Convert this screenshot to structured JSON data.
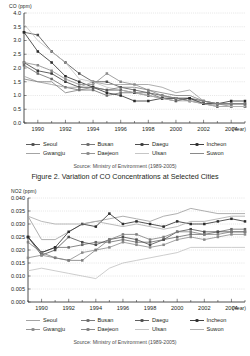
{
  "figure1": {
    "axis_label": "CO (ppm)",
    "source": "Source: Ministry of Environment (1989-2005)",
    "caption": "Figure 2. Variation of CO Concentrations at Selected Cities",
    "legend": [
      {
        "label": "Seoul",
        "color": "#4d4d4d",
        "marker": "square"
      },
      {
        "label": "Busan",
        "color": "#6b6b6b",
        "marker": "square"
      },
      {
        "label": "Daegu",
        "color": "#3a3a3a",
        "marker": "square"
      },
      {
        "label": "Incheon",
        "color": "#2b2b2b",
        "marker": "square"
      },
      {
        "label": "Gwangju",
        "color": "#9a9a9a",
        "marker": "none"
      },
      {
        "label": "Daejeon",
        "color": "#8a8a8a",
        "marker": "square"
      },
      {
        "label": "Ulsan",
        "color": "#c0c0c0",
        "marker": "none"
      },
      {
        "label": "Suwon",
        "color": "#7d7d7d",
        "marker": "none"
      }
    ]
  },
  "figure2": {
    "axis_label": "NO2 (ppm)",
    "source": "Source: Ministry of Environment (1989-2005)",
    "legend": [
      {
        "label": "Seoul",
        "color": "#9a9a9a",
        "marker": "none"
      },
      {
        "label": "Busan",
        "color": "#6b6b6b",
        "marker": "square"
      },
      {
        "label": "Daegu",
        "color": "#4d4d4d",
        "marker": "square"
      },
      {
        "label": "Incheon",
        "color": "#2b2b2b",
        "marker": "square"
      },
      {
        "label": "Gwangju",
        "color": "#8a8a8a",
        "marker": "square"
      },
      {
        "label": "Daejeon",
        "color": "#7d7d7d",
        "marker": "square"
      },
      {
        "label": "Ulsan",
        "color": "#c0c0c0",
        "marker": "none"
      },
      {
        "label": "Suwon",
        "color": "#a8a8a8",
        "marker": "none"
      }
    ]
  },
  "chart_data": [
    {
      "id": "co",
      "type": "line",
      "title": "Figure 2. Variation of CO Concentrations at Selected Cities",
      "xlabel": "(Year)",
      "ylabel": "CO (ppm)",
      "ylim": [
        0.0,
        4.0
      ],
      "ytick_labels": [
        "4.0",
        "3.5",
        "3.0",
        "2.5",
        "2.0",
        "1.5",
        "1.0",
        "0.5",
        "0.0"
      ],
      "ytick_values": [
        4.0,
        3.5,
        3.0,
        2.5,
        2.0,
        1.5,
        1.0,
        0.5,
        0.0
      ],
      "xlim": [
        1989,
        2005
      ],
      "x": [
        1989,
        1990,
        1991,
        1992,
        1993,
        1994,
        1995,
        1996,
        1997,
        1998,
        1999,
        2000,
        2001,
        2002,
        2003,
        2004,
        2005
      ],
      "xtick_labels": [
        "1990",
        "1992",
        "1994",
        "1996",
        "1998",
        "2000",
        "2002",
        "2004"
      ],
      "xtick_values": [
        1990,
        1992,
        1994,
        1996,
        1998,
        2000,
        2002,
        2004
      ],
      "grid": true,
      "legend_position": "below",
      "series": [
        {
          "name": "Seoul",
          "color": "#4d4d4d",
          "marker": "square",
          "values": [
            3.3,
            3.2,
            2.6,
            2.2,
            1.8,
            1.5,
            1.5,
            1.3,
            1.2,
            1.1,
            1.0,
            0.9,
            0.9,
            0.8,
            0.7,
            0.7,
            0.7
          ]
        },
        {
          "name": "Busan",
          "color": "#6b6b6b",
          "marker": "square",
          "values": [
            2.1,
            1.8,
            1.6,
            1.3,
            1.2,
            1.2,
            1.0,
            1.1,
            1.1,
            1.1,
            0.9,
            0.9,
            0.9,
            0.7,
            0.7,
            0.7,
            0.7
          ]
        },
        {
          "name": "Daegu",
          "color": "#3a3a3a",
          "marker": "square",
          "values": [
            2.2,
            1.9,
            1.8,
            1.5,
            1.3,
            1.3,
            1.2,
            1.2,
            1.1,
            1.0,
            0.9,
            0.9,
            0.8,
            0.7,
            0.6,
            0.6,
            0.6
          ]
        },
        {
          "name": "Incheon",
          "color": "#2b2b2b",
          "marker": "square",
          "values": [
            3.3,
            2.6,
            2.2,
            1.7,
            1.5,
            1.3,
            1.1,
            1.0,
            0.8,
            0.8,
            0.9,
            0.8,
            0.9,
            0.7,
            0.7,
            0.8,
            0.8
          ]
        },
        {
          "name": "Gwangju",
          "color": "#9a9a9a",
          "marker": "none",
          "values": [
            1.7,
            1.5,
            1.4,
            1.3,
            1.3,
            1.5,
            1.4,
            1.4,
            1.4,
            1.4,
            1.3,
            1.1,
            1.2,
            0.8,
            0.7,
            0.7,
            0.7
          ]
        },
        {
          "name": "Daejeon",
          "color": "#8a8a8a",
          "marker": "square",
          "values": [
            2.2,
            2.1,
            1.9,
            1.6,
            1.4,
            1.4,
            1.8,
            1.5,
            1.4,
            1.2,
            1.0,
            0.9,
            0.8,
            0.8,
            0.7,
            0.6,
            0.6
          ]
        },
        {
          "name": "Ulsan",
          "color": "#c0c0c0",
          "marker": "none",
          "values": [
            3.6,
            3.0,
            2.6,
            2.2,
            1.6,
            1.5,
            1.3,
            1.2,
            1.1,
            1.0,
            0.9,
            0.8,
            0.8,
            0.7,
            0.6,
            0.6,
            0.6
          ]
        },
        {
          "name": "Suwon",
          "color": "#7d7d7d",
          "marker": "none",
          "values": [
            1.6,
            1.5,
            1.5,
            1.1,
            1.2,
            1.3,
            1.2,
            1.3,
            1.3,
            1.2,
            1.1,
            1.0,
            1.0,
            0.8,
            0.7,
            0.7,
            0.7
          ]
        }
      ]
    },
    {
      "id": "no2",
      "type": "line",
      "title": "",
      "xlabel": "(Year)",
      "ylabel": "NO2 (ppm)",
      "ylim": [
        0.0,
        0.04
      ],
      "ytick_labels": [
        "0.040",
        "0.035",
        "0.030",
        "0.025",
        "0.020",
        "0.015",
        "0.010",
        "0.005",
        "0.000"
      ],
      "ytick_values": [
        0.04,
        0.035,
        0.03,
        0.025,
        0.02,
        0.015,
        0.01,
        0.005,
        0.0
      ],
      "xlim": [
        1989,
        2005
      ],
      "x": [
        1989,
        1990,
        1991,
        1992,
        1993,
        1994,
        1995,
        1996,
        1997,
        1998,
        1999,
        2000,
        2001,
        2002,
        2003,
        2004,
        2005
      ],
      "xtick_labels": [
        "1990",
        "1992",
        "1994",
        "1996",
        "1998",
        "2000",
        "2002",
        "2004"
      ],
      "xtick_values": [
        1990,
        1992,
        1994,
        1996,
        1998,
        2000,
        2002,
        2004
      ],
      "grid": true,
      "legend_position": "below",
      "series": [
        {
          "name": "Seoul",
          "color": "#9a9a9a",
          "marker": "none",
          "values": [
            0.033,
            0.024,
            0.024,
            0.027,
            0.03,
            0.031,
            0.032,
            0.033,
            0.032,
            0.031,
            0.033,
            0.034,
            0.036,
            0.035,
            0.034,
            0.034,
            0.034
          ]
        },
        {
          "name": "Busan",
          "color": "#6b6b6b",
          "marker": "square",
          "values": [
            0.025,
            0.019,
            0.021,
            0.021,
            0.022,
            0.023,
            0.023,
            0.024,
            0.023,
            0.023,
            0.024,
            0.025,
            0.026,
            0.026,
            0.027,
            0.028,
            0.028
          ]
        },
        {
          "name": "Daegu",
          "color": "#4d4d4d",
          "marker": "square",
          "values": [
            0.025,
            0.018,
            0.02,
            0.025,
            0.023,
            0.022,
            0.024,
            0.025,
            0.024,
            0.022,
            0.024,
            0.027,
            0.028,
            0.027,
            0.027,
            0.027,
            0.027
          ]
        },
        {
          "name": "Incheon",
          "color": "#2b2b2b",
          "marker": "square",
          "values": [
            0.025,
            0.019,
            0.021,
            0.027,
            0.03,
            0.029,
            0.034,
            0.03,
            0.031,
            0.03,
            0.029,
            0.031,
            0.03,
            0.03,
            0.031,
            0.032,
            0.031
          ]
        },
        {
          "name": "Gwangju",
          "color": "#8a8a8a",
          "marker": "square",
          "values": [
            0.017,
            0.018,
            0.017,
            0.016,
            0.019,
            0.02,
            0.021,
            0.023,
            0.022,
            0.021,
            0.022,
            0.024,
            0.025,
            0.024,
            0.025,
            0.026,
            0.026
          ]
        },
        {
          "name": "Daejeon",
          "color": "#7d7d7d",
          "marker": "square",
          "values": [
            0.023,
            0.019,
            0.017,
            0.016,
            0.016,
            0.02,
            0.024,
            0.026,
            0.026,
            0.024,
            0.025,
            0.027,
            0.027,
            0.026,
            0.026,
            0.027,
            0.027
          ]
        },
        {
          "name": "Ulsan",
          "color": "#c0c0c0",
          "marker": "none",
          "values": [
            0.012,
            0.013,
            0.012,
            0.011,
            0.01,
            0.009,
            0.013,
            0.015,
            0.016,
            0.017,
            0.018,
            0.019,
            0.021,
            0.021,
            0.021,
            0.021,
            0.021
          ]
        },
        {
          "name": "Suwon",
          "color": "#a8a8a8",
          "marker": "none",
          "values": [
            0.033,
            0.031,
            0.03,
            0.03,
            0.03,
            0.031,
            0.03,
            0.029,
            0.03,
            0.029,
            0.028,
            0.029,
            0.031,
            0.031,
            0.032,
            0.033,
            0.033
          ]
        }
      ]
    }
  ]
}
